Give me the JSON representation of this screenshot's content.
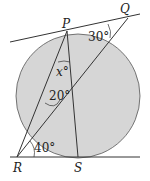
{
  "diagram": {
    "points": {
      "P": "P",
      "Q": "Q",
      "R": "R",
      "S": "S"
    },
    "angles": {
      "at_Q": "30°",
      "at_P": "x°",
      "inner": "20°",
      "at_R": "40°"
    },
    "colors": {
      "circle_fill": "#d6d6d6",
      "stroke": "#333333"
    }
  }
}
